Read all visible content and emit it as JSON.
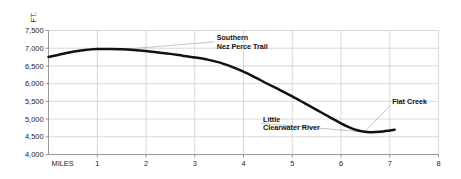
{
  "chart_data": {
    "type": "line",
    "title": "",
    "xlabel": "MILES",
    "ylabel": "FT.",
    "xlim": [
      0,
      8
    ],
    "ylim": [
      4000,
      7500
    ],
    "grid": true,
    "legend_position": "none",
    "x_ticks": [
      "1",
      "2",
      "3",
      "4",
      "5",
      "6",
      "7",
      "8"
    ],
    "x_tick_values": [
      1,
      2,
      3,
      4,
      5,
      6,
      7,
      8
    ],
    "y_ticks": [
      "7,500",
      "7,000",
      "6,500",
      "6,000",
      "5,500",
      "5,000",
      "4,500",
      "4,000"
    ],
    "y_tick_values": [
      7500,
      7000,
      6500,
      6000,
      5500,
      5000,
      4500,
      4000
    ],
    "series": [
      {
        "name": "Elevation profile",
        "color": "#121212",
        "x": [
          0.0,
          0.25,
          0.5,
          0.75,
          1.0,
          1.25,
          1.5,
          1.75,
          2.0,
          2.25,
          2.5,
          2.75,
          3.0,
          3.25,
          3.5,
          3.75,
          4.0,
          4.25,
          4.5,
          4.75,
          5.0,
          5.25,
          5.5,
          5.75,
          6.0,
          6.15,
          6.3,
          6.45,
          6.6,
          6.8,
          7.0,
          7.1
        ],
        "y": [
          6750,
          6830,
          6900,
          6950,
          6975,
          6980,
          6970,
          6950,
          6920,
          6880,
          6840,
          6790,
          6740,
          6680,
          6600,
          6480,
          6340,
          6170,
          5990,
          5820,
          5640,
          5450,
          5260,
          5070,
          4880,
          4780,
          4700,
          4650,
          4628,
          4640,
          4680,
          4700
        ]
      }
    ],
    "annotations": [
      {
        "id": "southern-nez-perce-trail",
        "line1": "Southern",
        "line2": "Nez Perce Trail",
        "anchor_x": 1.42,
        "anchor_y": 6955,
        "label_x": 3.45,
        "label_y": 7180
      },
      {
        "id": "little-clearwater-river",
        "line1": "Little",
        "line2": "Clearwater River",
        "anchor_x": 6.52,
        "anchor_y": 4632,
        "label_x": 4.4,
        "label_y": 4880
      },
      {
        "id": "flat-creek",
        "line1": "Flat Creek",
        "line2": "",
        "anchor_x": 6.5,
        "anchor_y": 4660,
        "label_x": 7.05,
        "label_y": 5380
      }
    ]
  }
}
